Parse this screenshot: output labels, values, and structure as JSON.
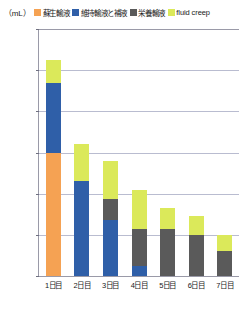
{
  "axis_unit_label": "（mL）",
  "legend": [
    {
      "label": "蘇生輸液",
      "color": "#f5a253",
      "script": "jp"
    },
    {
      "label": "維持輸液と補液",
      "color": "#2f5fa8",
      "script": "jp"
    },
    {
      "label": "栄養輸液",
      "color": "#5a5a5a",
      "script": "jp"
    },
    {
      "label": "fluid creep",
      "color": "#dbe95a",
      "script": "latin"
    }
  ],
  "chart_data": {
    "type": "bar",
    "title": "",
    "subtitle": "",
    "xlabel": "",
    "ylabel": "（mL）",
    "ylim": [
      0,
      6000
    ],
    "yticks": [
      0,
      1000,
      2000,
      3000,
      4000,
      5000,
      6000
    ],
    "ytick_labels": [
      "0",
      "1,000",
      "2,000",
      "3,000",
      "4,000",
      "5,000",
      "6,000"
    ],
    "grid": true,
    "stacked": true,
    "legend_position": "top",
    "categories": [
      "1日目",
      "2日目",
      "3日目",
      "4日目",
      "5日目",
      "6日目",
      "7日目"
    ],
    "series": [
      {
        "name": "蘇生輸液",
        "color": "#f5a253",
        "values": [
          3000,
          0,
          0,
          0,
          0,
          0,
          0
        ]
      },
      {
        "name": "維持輸液と補液",
        "color": "#2f5fa8",
        "values": [
          1700,
          2300,
          1350,
          250,
          0,
          0,
          0
        ]
      },
      {
        "name": "栄養輸液",
        "color": "#5a5a5a",
        "values": [
          0,
          0,
          520,
          900,
          1150,
          1000,
          600
        ]
      },
      {
        "name": "fluid creep",
        "color": "#dbe95a",
        "values": [
          550,
          900,
          930,
          950,
          500,
          450,
          400
        ]
      }
    ],
    "totals": [
      5250,
      3200,
      2800,
      2100,
      1650,
      1450,
      1000
    ]
  }
}
